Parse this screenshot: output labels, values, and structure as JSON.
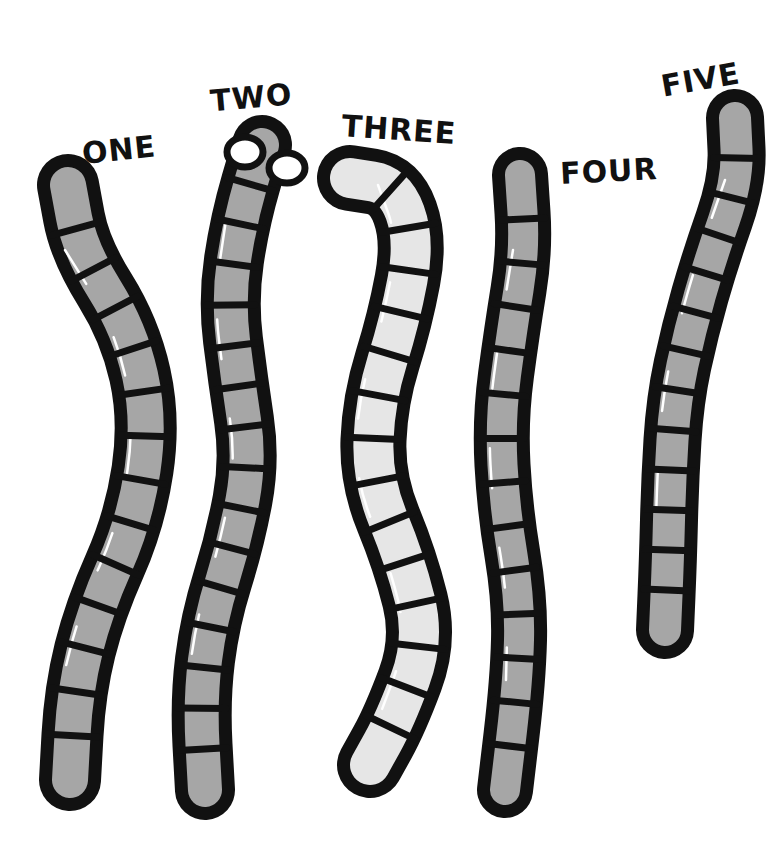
{
  "illustration": {
    "subject": "Five cartoon worms with labels",
    "colors": {
      "background": "#ffffff",
      "outline": "#111111",
      "fill_default": "#a6a6a6",
      "fill_light": "#e6e6e6",
      "highlight": "#ffffff",
      "eye": "#ffffff"
    },
    "worms": [
      {
        "id": "one",
        "label": "ONE",
        "fill": "default",
        "has_eyes": false,
        "segments": 14
      },
      {
        "id": "two",
        "label": "TWO",
        "fill": "default",
        "has_eyes": true,
        "segments": 16
      },
      {
        "id": "three",
        "label": "THREE",
        "fill": "light",
        "has_eyes": false,
        "segments": 15
      },
      {
        "id": "four",
        "label": "FOUR",
        "fill": "default",
        "has_eyes": false,
        "segments": 14
      },
      {
        "id": "five",
        "label": "FIVE",
        "fill": "default",
        "has_eyes": false,
        "segments": 13
      }
    ]
  }
}
